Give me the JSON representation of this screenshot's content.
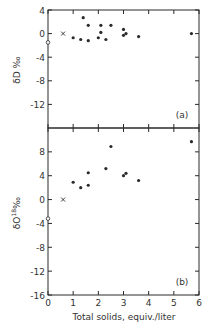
{
  "chart_data": [
    {
      "panel": "(a)",
      "type": "scatter",
      "ylabel": "δD ‰",
      "xlabel": "",
      "xlim": [
        0,
        6
      ],
      "ylim": [
        -16,
        4
      ],
      "yticks": [
        4,
        0,
        -4,
        -8,
        -12
      ],
      "xticks": [
        0,
        1,
        2,
        3,
        4,
        5,
        6
      ],
      "grid": false,
      "series": [
        {
          "name": "solid-dots",
          "marker": "filled-circle",
          "points": [
            [
              1.0,
              -0.7
            ],
            [
              1.3,
              -1.0
            ],
            [
              1.4,
              2.7
            ],
            [
              1.6,
              1.4
            ],
            [
              1.6,
              -1.2
            ],
            [
              2.0,
              -0.7
            ],
            [
              2.1,
              1.4
            ],
            [
              2.1,
              0.2
            ],
            [
              2.3,
              -1.0
            ],
            [
              2.5,
              1.4
            ],
            [
              3.0,
              -0.3
            ],
            [
              3.0,
              0.7
            ],
            [
              3.1,
              0.0
            ],
            [
              3.6,
              -0.5
            ],
            [
              5.7,
              0.0
            ]
          ]
        },
        {
          "name": "x-marker",
          "marker": "x",
          "points": [
            [
              0.6,
              0.0
            ]
          ]
        },
        {
          "name": "open-circle",
          "marker": "open-circle",
          "points": [
            [
              0.0,
              -1.5
            ]
          ]
        }
      ]
    },
    {
      "panel": "(b)",
      "type": "scatter",
      "ylabel": "δO18 ‰",
      "xlabel": "Total solids, equiv./liter",
      "xlim": [
        0,
        6
      ],
      "ylim": [
        -16,
        12
      ],
      "yticks": [
        8,
        4,
        0,
        -4,
        -8,
        -12,
        -16
      ],
      "xticks": [
        0,
        1,
        2,
        3,
        4,
        5,
        6
      ],
      "grid": false,
      "series": [
        {
          "name": "solid-dots",
          "marker": "filled-circle",
          "points": [
            [
              1.0,
              2.9
            ],
            [
              1.3,
              2.0
            ],
            [
              1.6,
              4.5
            ],
            [
              1.6,
              2.4
            ],
            [
              2.3,
              5.2
            ],
            [
              2.5,
              8.9
            ],
            [
              3.0,
              4.0
            ],
            [
              3.1,
              4.4
            ],
            [
              3.6,
              3.2
            ],
            [
              5.7,
              9.7
            ]
          ]
        },
        {
          "name": "x-marker",
          "marker": "x",
          "points": [
            [
              0.6,
              0.0
            ]
          ]
        },
        {
          "name": "open-circle",
          "marker": "open-circle",
          "points": [
            [
              0.0,
              -3.2
            ]
          ]
        }
      ]
    }
  ],
  "labels": {
    "panel_a_tag": "(a)",
    "panel_b_tag": "(b)",
    "y_label_a": "δD ‰",
    "y_label_b_main": "δO",
    "y_label_b_sup": "18",
    "y_label_b_unit": "‰",
    "x_label": "Total solids, equiv./liter"
  },
  "colors": {
    "ink": "#2a2a2a",
    "background": "#ffffff"
  }
}
